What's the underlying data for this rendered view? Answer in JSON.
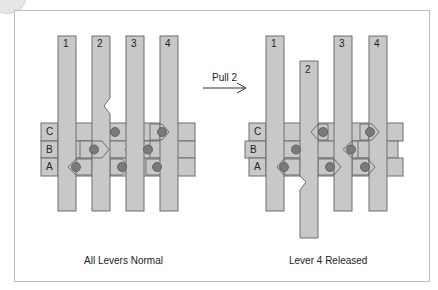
{
  "diagram": {
    "left": {
      "caption": "All Levers Normal",
      "bar_labels": [
        "C",
        "B",
        "A"
      ],
      "lever_labels": [
        "1",
        "2",
        "3",
        "4"
      ]
    },
    "right": {
      "caption": "Lever 4 Released",
      "bar_labels": [
        "C",
        "B",
        "A"
      ],
      "lever_labels": [
        "1",
        "2",
        "3",
        "4"
      ]
    },
    "action_label": "Pull 2",
    "colors": {
      "fill": "#c8c8c8",
      "stroke": "#6e6e6e",
      "pin": "#7a7a7a",
      "frame": "#bdbdbd"
    }
  }
}
